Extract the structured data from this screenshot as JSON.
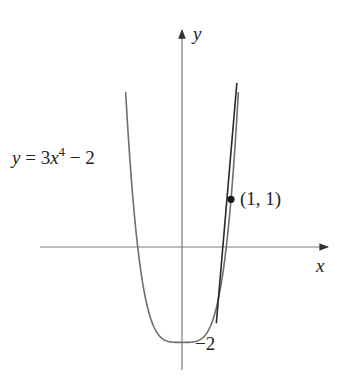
{
  "chart_data": {
    "type": "line",
    "title": "",
    "xlabel": "x",
    "ylabel": "y",
    "grid": false,
    "series": [
      {
        "name": "y = 3x^4 - 2",
        "function": "3*x^4 - 2",
        "x": [
          -1.15,
          -1.0,
          -0.9,
          -0.8,
          -0.6,
          -0.4,
          -0.2,
          0,
          0.2,
          0.4,
          0.6,
          0.8,
          0.9,
          1.0,
          1.15
        ],
        "values": [
          3.25,
          1.0,
          -0.03,
          -0.77,
          -1.61,
          -1.92,
          -2.0,
          -2.0,
          -2.0,
          -1.92,
          -1.61,
          -0.77,
          -0.03,
          1.0,
          3.25
        ]
      },
      {
        "name": "tangent line at (1, 1)",
        "function": "12*x - 10",
        "x": [
          0.7,
          1.12
        ],
        "values": [
          -1.6,
          3.44
        ]
      }
    ],
    "annotations": [
      {
        "text": "(1, 1)",
        "x": 1,
        "y": 1,
        "marker": "filled-dot"
      },
      {
        "text": "−2",
        "x": 0,
        "y": -2,
        "note": "y-intercept / tangent reference"
      }
    ],
    "colors": {
      "curve": "#6e6e6e",
      "tangent": "#2a2a2a",
      "axes": "#777777",
      "text": "#222222"
    }
  },
  "labels": {
    "x_axis": "x",
    "y_axis": "y",
    "equation_prefix": "y = 3",
    "equation_var": "x",
    "equation_exp": "4",
    "equation_suffix": " − 2",
    "point": "(1, 1)",
    "minus_two": "−2"
  }
}
